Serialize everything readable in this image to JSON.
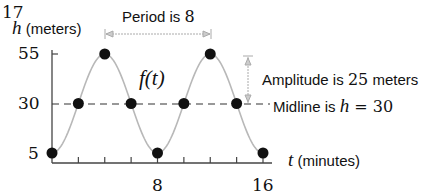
{
  "chart_data": {
    "type": "line",
    "title": "",
    "corner_label": "17",
    "xlabel_var": "t",
    "xlabel_unit": "(minutes)",
    "ylabel_var": "h",
    "ylabel_unit": "(meters)",
    "function_label": "f(t)",
    "x_ticks": [
      8,
      16
    ],
    "y_ticks": [
      55,
      30,
      5
    ],
    "xlim": [
      0,
      16
    ],
    "ylim": [
      5,
      55
    ],
    "midline": 30,
    "amplitude": 25,
    "period": 8,
    "points": [
      {
        "t": 0,
        "h": 5
      },
      {
        "t": 2,
        "h": 30
      },
      {
        "t": 4,
        "h": 55
      },
      {
        "t": 6,
        "h": 30
      },
      {
        "t": 8,
        "h": 5
      },
      {
        "t": 10,
        "h": 30
      },
      {
        "t": 12,
        "h": 55
      },
      {
        "t": 14,
        "h": 30
      },
      {
        "t": 16,
        "h": 5
      }
    ],
    "annotations": {
      "period_prefix": "Period is ",
      "period_value": "8",
      "amplitude_prefix": "Amplitude is ",
      "amplitude_value": "25",
      "amplitude_suffix": " meters",
      "midline_prefix": "Midline is ",
      "midline_var": "h",
      "midline_eq": " = 30"
    },
    "grid": false
  }
}
